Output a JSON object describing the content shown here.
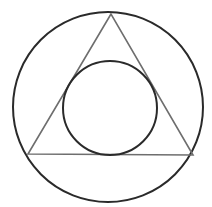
{
  "diagram": {
    "outer_circle": {
      "cx": 108,
      "cy": 107,
      "r": 95,
      "stroke": "#2a2a2a",
      "stroke_width": 2
    },
    "triangle": {
      "points": "111,14 28,154 193,155",
      "stroke": "#6e6e6e",
      "stroke_width": 1.6
    },
    "inner_circle": {
      "cx": 110,
      "cy": 108,
      "r": 47,
      "stroke": "#2a2a2a",
      "stroke_width": 2
    }
  }
}
